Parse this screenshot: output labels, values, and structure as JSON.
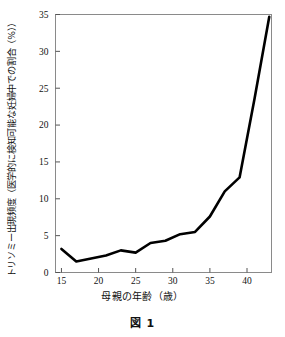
{
  "figure": {
    "caption": "図 1",
    "xlabel": "母親の年齢（歳）",
    "ylabel": "トリソミー出現頻度（医学的に検知可能な妊婦中での割合（%））"
  },
  "chart_data": {
    "type": "line",
    "title": "図 1",
    "xlabel": "母親の年齢（歳）",
    "ylabel": "トリソミー出現頻度（医学的に検知可能な妊婦中での割合（%））",
    "xlim": [
      14.2,
      43.3
    ],
    "ylim": [
      0,
      35
    ],
    "xticks": [
      15,
      20,
      25,
      30,
      35,
      40
    ],
    "yticks": [
      0,
      5,
      10,
      15,
      20,
      25,
      30,
      35
    ],
    "xtick_labels": [
      "15",
      "20",
      "25",
      "30",
      "35",
      "40"
    ],
    "ytick_labels": [
      "0",
      "5",
      "10",
      "15",
      "20",
      "25",
      "30",
      "35"
    ],
    "grid": false,
    "legend": false,
    "line_color": "#000000",
    "line_width": 2.6,
    "series": [
      {
        "name": "トリソミー出現頻度",
        "x": [
          15,
          17,
          19,
          21,
          23,
          25,
          27,
          29,
          31,
          33,
          35,
          37,
          39,
          41,
          43
        ],
        "values": [
          3.2,
          1.5,
          1.9,
          2.3,
          3.0,
          2.7,
          4.0,
          4.3,
          5.2,
          5.5,
          7.6,
          11.0,
          12.9,
          23.5,
          34.7
        ]
      }
    ]
  },
  "axis": {
    "border_color": "#8a8a8a",
    "tick_color": "#555555"
  }
}
